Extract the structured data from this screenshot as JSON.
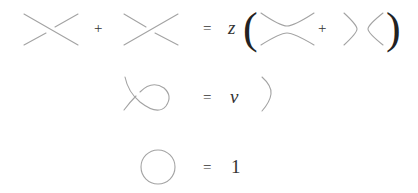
{
  "diagram": {
    "relations": [
      {
        "id": "skein-relation",
        "lhs": [
          "positive-crossing",
          "+",
          "negative-crossing"
        ],
        "equals": "=",
        "coefficient": "z",
        "open_paren": "(",
        "rhs": [
          "horizontal-smoothing",
          "+",
          "vertical-smoothing"
        ],
        "close_paren": ")"
      },
      {
        "id": "kink-relation",
        "lhs": [
          "kink-curl"
        ],
        "equals": "=",
        "coefficient": "v",
        "rhs": [
          "straight-strand"
        ]
      },
      {
        "id": "unknot-relation",
        "lhs": [
          "unknot-circle"
        ],
        "equals": "=",
        "rhs_value": "1"
      }
    ],
    "colors": {
      "strand": "#a0a0a0",
      "text": "#333333"
    }
  }
}
